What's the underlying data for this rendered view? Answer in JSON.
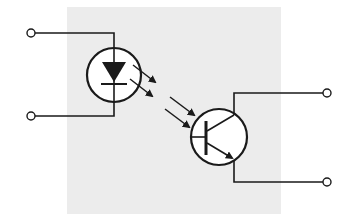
{
  "diagram": {
    "type": "optocoupler schematic",
    "components": [
      {
        "id": "led",
        "label": "light-emitting diode (input)"
      },
      {
        "id": "phototransistor",
        "label": "NPN phototransistor (output)"
      }
    ],
    "terminals": [
      {
        "id": "input-anode",
        "side": "left"
      },
      {
        "id": "input-cathode",
        "side": "left"
      },
      {
        "id": "output-collector",
        "side": "right"
      },
      {
        "id": "output-emitter",
        "side": "right"
      }
    ],
    "light_path": "two arrows emitted by LED, two arrows received by transistor base",
    "colors": {
      "background": "#ffffff",
      "package": "#ececec",
      "stroke": "#1a1a1a"
    }
  }
}
